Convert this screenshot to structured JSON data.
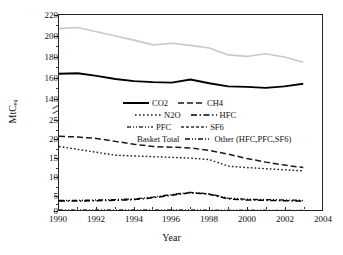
{
  "chart_data": {
    "type": "line",
    "title": "",
    "xlabel": "Year",
    "ylabel": "MtC",
    "ylabel_sub": "eq",
    "xlim": [
      1990,
      2004
    ],
    "xticks": [
      1990,
      1992,
      1994,
      1996,
      1998,
      2000,
      2002,
      2004
    ],
    "yticks_lower": [
      0,
      5,
      10,
      15,
      20,
      25
    ],
    "yticks_upper": [
      140,
      160,
      180,
      200,
      220
    ],
    "y_axis_break": true,
    "grid": false,
    "legend_position": "inside-center",
    "x": [
      1990,
      1991,
      1992,
      1993,
      1994,
      1995,
      1996,
      1997,
      1998,
      1999,
      2000,
      2001,
      2002,
      2003
    ],
    "series": [
      {
        "name": "CO2",
        "style": "solid-thick",
        "color": "#000000",
        "values": [
          165,
          165.5,
          163,
          160,
          158,
          157,
          156.5,
          159.5,
          156,
          153,
          152.5,
          151.5,
          153,
          155.5
        ]
      },
      {
        "name": "CH4",
        "style": "dashed",
        "color": "#1a1a1a",
        "values": [
          20.8,
          20.6,
          20.2,
          19.4,
          18.6,
          18,
          17.8,
          17.6,
          16.9,
          15.9,
          14.7,
          13.7,
          12.9,
          12.2
        ]
      },
      {
        "name": "N2O",
        "style": "dotted",
        "color": "#1a1a1a",
        "values": [
          18,
          17.2,
          16.4,
          15.6,
          15.4,
          15.2,
          15,
          14.8,
          14.4,
          12.6,
          12.2,
          11.9,
          11.6,
          11.3
        ]
      },
      {
        "name": "HFC",
        "style": "dash-dot",
        "color": "#000000",
        "values": [
          3,
          3,
          3.1,
          3.2,
          3.4,
          3.9,
          4.6,
          5.3,
          4.9,
          3.6,
          3.3,
          3.2,
          3.1,
          3.0
        ]
      },
      {
        "name": "PFC",
        "style": "dash-dot-dot",
        "color": "#333333",
        "values": [
          0.6,
          0.6,
          0.6,
          0.6,
          0.6,
          0.6,
          0.6,
          0.6,
          0.55,
          0.5,
          0.5,
          0.5,
          0.45,
          0.45
        ]
      },
      {
        "name": "SF6",
        "style": "short-dash",
        "color": "#333333",
        "values": [
          0.3,
          0.3,
          0.3,
          0.3,
          0.3,
          0.3,
          0.3,
          0.3,
          0.28,
          0.25,
          0.25,
          0.25,
          0.22,
          0.22
        ]
      },
      {
        "name": "Basket Total",
        "style": "solid-light",
        "color": "#c9c9c9",
        "values": [
          208,
          209,
          205,
          201,
          197,
          192.5,
          194,
          192,
          189.5,
          183,
          181.5,
          184,
          181,
          176
        ]
      },
      {
        "name": "Other (HFC,PFC,SF6)",
        "style": "dash-dot-dot",
        "color": "#111111",
        "values": [
          3.2,
          3.2,
          3.3,
          3.4,
          3.6,
          4.1,
          4.8,
          5.4,
          5.0,
          3.8,
          3.5,
          3.4,
          3.3,
          3.2
        ]
      }
    ]
  },
  "axes": {
    "x_title": "Year",
    "y_title": "MtC",
    "y_title_sub": "eq",
    "x_labels": [
      "1990",
      "1992",
      "1994",
      "1996",
      "1998",
      "2000",
      "2002",
      "2004"
    ],
    "y_labels_upper": [
      "220",
      "200",
      "180",
      "160",
      "140"
    ],
    "y_labels_lower": [
      "25",
      "20",
      "15",
      "10",
      "5",
      "0"
    ]
  },
  "legend": {
    "row1": [
      {
        "label": "CO2",
        "style": "solid-thick"
      },
      {
        "label": "CH4",
        "style": "dashed"
      }
    ],
    "row2": [
      {
        "label": "N2O",
        "style": "dotted"
      },
      {
        "label": "HFC",
        "style": "dash-dot"
      }
    ],
    "row3": [
      {
        "label": "PFC",
        "style": "dash-dot-dot"
      },
      {
        "label": "SF6",
        "style": "short-dash"
      }
    ],
    "row4": [
      {
        "label": "Basket Total",
        "style": "solid-light-text"
      },
      {
        "label": "Other (HFC,PFC,SF6)",
        "style": "dash-dot-dot"
      }
    ]
  }
}
